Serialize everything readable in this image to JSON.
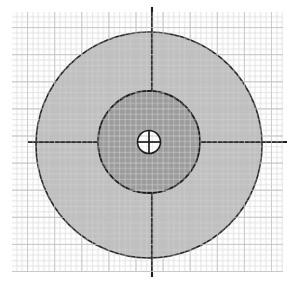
{
  "canvas": {
    "width": 294,
    "height": 283,
    "background_color": "#ffffff"
  },
  "grid": {
    "name": "graph-paper-grid",
    "x": 12,
    "y": 12,
    "width": 271,
    "height": 260,
    "minor_spacing": 5.42,
    "major_spacing": 27.1,
    "minor_color": "#dcdcdc",
    "major_color": "#c8c8c8",
    "minor_width": 0.9,
    "major_width": 1.3
  },
  "chart_data": {
    "type": "scatter",
    "title": "",
    "xlabel": "",
    "ylabel": "",
    "grid": true,
    "legend": "none",
    "shapes": [
      {
        "name": "outer-disc",
        "kind": "circle",
        "cx": 149,
        "cy": 145,
        "r": 113,
        "fill": "#9a9a9a",
        "fill_opacity": 0.62,
        "stroke": "#262626",
        "stroke_width": 1.6,
        "grid_visible_through": true
      },
      {
        "name": "middle-disc",
        "kind": "circle",
        "cx": 149,
        "cy": 142,
        "r": 51,
        "fill": "#9b9b9b",
        "fill_opacity": 1,
        "stroke": "#1c1c1c",
        "stroke_width": 1.8,
        "grid_visible_through": false
      },
      {
        "name": "inner-hole",
        "kind": "circle",
        "cx": 149,
        "cy": 142,
        "r": 11.5,
        "fill": "none",
        "fill_opacity": 0,
        "stroke": "#1c1c1c",
        "stroke_width": 1.6,
        "grid_visible_through": true
      }
    ],
    "crosshairs": [
      {
        "name": "horizontal-axis-left",
        "orientation": "horizontal",
        "x1": 28,
        "y1": 142,
        "x2": 103,
        "y2": 142,
        "color": "#1c1c1c",
        "width": 2.1
      },
      {
        "name": "horizontal-axis-right",
        "orientation": "horizontal",
        "x1": 195,
        "y1": 142,
        "x2": 287,
        "y2": 142,
        "color": "#1c1c1c",
        "width": 2.1
      },
      {
        "name": "vertical-axis-top",
        "orientation": "vertical",
        "x1": 152,
        "y1": 7,
        "x2": 152,
        "y2": 93,
        "color": "#1c1c1c",
        "width": 2.1
      },
      {
        "name": "vertical-axis-bottom",
        "orientation": "vertical",
        "x1": 152,
        "y1": 192,
        "x2": 152,
        "y2": 277,
        "color": "#1c1c1c",
        "width": 2.1
      },
      {
        "name": "center-crosshair-horizontal",
        "orientation": "horizontal",
        "x1": 137,
        "y1": 142,
        "x2": 161,
        "y2": 142,
        "color": "#1c1c1c",
        "width": 1.7
      },
      {
        "name": "center-crosshair-vertical",
        "orientation": "vertical",
        "x1": 149,
        "y1": 130,
        "x2": 149,
        "y2": 154,
        "color": "#1c1c1c",
        "width": 1.7
      }
    ]
  }
}
